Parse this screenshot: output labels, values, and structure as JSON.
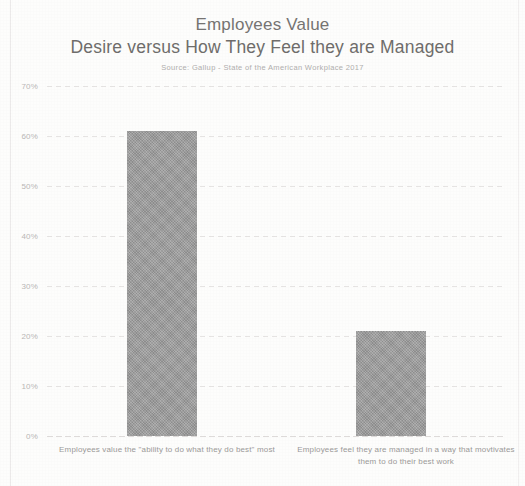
{
  "chart_data": {
    "type": "bar",
    "title": "Employees Value",
    "title_line2": "Desire versus How They Feel they are Managed",
    "subtitle": "Source: Gallup - State of the American Workplace 2017",
    "categories": [
      "Employees value the \"ability to do what they do best\" most",
      "Employees feel they are managed in a way that movtivates them to do their best work"
    ],
    "values": [
      61,
      21
    ],
    "xlabel": "",
    "ylabel": "",
    "ylim": [
      0,
      70
    ],
    "ytick_labels": [
      "70%",
      "60%",
      "50%",
      "40%",
      "30%",
      "20%",
      "10%",
      "0%"
    ],
    "ytick_values": [
      70,
      60,
      50,
      40,
      30,
      20,
      10,
      0
    ],
    "grid": true,
    "legend": "none",
    "bar_color": "#9d9d9d",
    "text_color": "#767472",
    "grid_color": "#e6e4e3"
  }
}
